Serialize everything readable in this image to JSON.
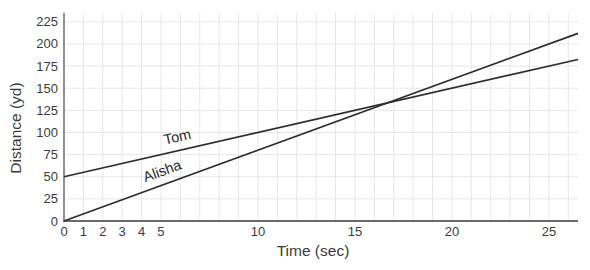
{
  "chart_data": {
    "type": "line",
    "title": "",
    "xlabel": "Time (sec)",
    "ylabel": "Distance (yd)",
    "xlim": [
      0,
      26.5
    ],
    "ylim": [
      0,
      235
    ],
    "x_ticks": [
      0,
      1,
      2,
      3,
      4,
      5,
      10,
      15,
      20,
      25
    ],
    "y_ticks": [
      0,
      25,
      50,
      75,
      100,
      125,
      150,
      175,
      200,
      225
    ],
    "grid": {
      "x_step": 1,
      "y_step": 25,
      "on": true
    },
    "legend_position": "inline-labels",
    "series": [
      {
        "name": "Tom",
        "x": [
          0,
          26.5
        ],
        "values": [
          50,
          182.5
        ],
        "intercept_yd": 50,
        "slope_yd_per_sec": 5,
        "label_anchor_x": 5.9
      },
      {
        "name": "Alisha",
        "x": [
          0,
          26.5
        ],
        "values": [
          0,
          212
        ],
        "intercept_yd": 0,
        "slope_yd_per_sec": 8,
        "label_anchor_x": 5.15
      }
    ],
    "colors": {
      "line": "#2d2d2d",
      "grid": "#e7e7e7",
      "y_axis": "#909090",
      "x_axis": "#6a6a6a",
      "tick_text": "#3b3b3b",
      "background": "#ffffff"
    }
  }
}
